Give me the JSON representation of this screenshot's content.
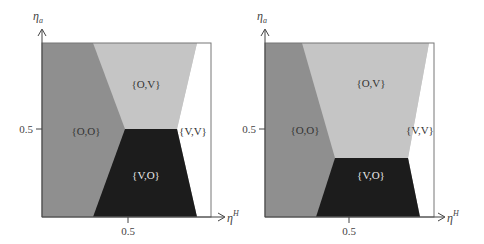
{
  "colors": {
    "region_OO": "#8f8f8f",
    "region_OV": "#c5c5c5",
    "region_VV": "#ffffff",
    "region_VO": "#1c1c1c",
    "frame": "#777777"
  },
  "axes": {
    "y_label_main": "η",
    "y_label_sub": "a",
    "x_label_main": "η",
    "x_label_sup": "H",
    "x_tick": "0.5",
    "y_tick": "0.5"
  },
  "panels": [
    {
      "regions": {
        "OO": "{O,O}",
        "OV": "{O,V}",
        "VV": "{V,V}",
        "VO": "{V,O}"
      }
    },
    {
      "regions": {
        "OO": "{O,O}",
        "OV": "{O,V}",
        "VV": "{V,V}",
        "VO": "{V,O}"
      }
    }
  ]
}
